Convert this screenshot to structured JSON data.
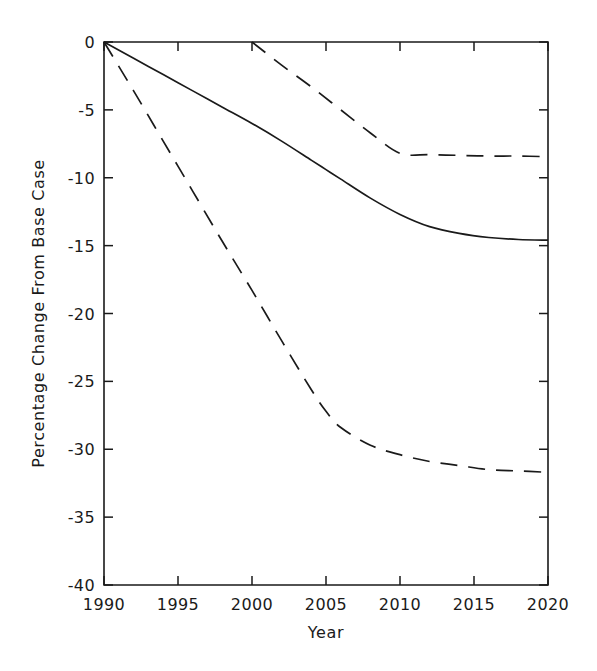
{
  "chart_data": {
    "type": "line",
    "title": "",
    "xlabel": "Year",
    "ylabel": "Percentage Change From Base Case",
    "xlim": [
      1990,
      2020
    ],
    "ylim": [
      -40,
      0
    ],
    "grid": false,
    "legend": "none",
    "background_color": "#ffffff",
    "line_color": "#1a1a1a",
    "xticks": [
      1990,
      1995,
      2000,
      2005,
      2010,
      2015,
      2020
    ],
    "xtick_labels": [
      "1990",
      "1995",
      "2000",
      "2005",
      "2010",
      "2015",
      "2020"
    ],
    "yticks": [
      0,
      -5,
      -10,
      -15,
      -20,
      -25,
      -30,
      -35,
      -40
    ],
    "ytick_labels": [
      "0",
      "-5",
      "-10",
      "-15",
      "-20",
      "-25",
      "-30",
      "-35",
      "-40"
    ],
    "series": [
      {
        "name": "middle-solid",
        "style": "solid",
        "x": [
          1990,
          1992,
          1994,
          1996,
          1998,
          2000,
          2002,
          2004,
          2005,
          2006,
          2008,
          2010,
          2012,
          2014,
          2016,
          2018,
          2020
        ],
        "values": [
          0,
          -1.2,
          -2.4,
          -3.6,
          -4.8,
          -6.0,
          -7.3,
          -8.7,
          -9.4,
          -10.1,
          -11.5,
          -12.7,
          -13.6,
          -14.1,
          -14.4,
          -14.55,
          -14.6
        ]
      },
      {
        "name": "lower-dashed",
        "style": "dashed",
        "x": [
          1990,
          1992,
          1994,
          1996,
          1998,
          2000,
          2002,
          2004,
          2005,
          2006,
          2008,
          2010,
          2012,
          2014,
          2016,
          2018,
          2020
        ],
        "values": [
          0,
          -3.6,
          -7.3,
          -11.0,
          -14.7,
          -18.3,
          -22.0,
          -25.6,
          -27.2,
          -28.4,
          -29.7,
          -30.4,
          -30.9,
          -31.2,
          -31.5,
          -31.6,
          -31.7
        ]
      },
      {
        "name": "upper-dashed",
        "style": "dashed",
        "x": [
          2000,
          2002,
          2004,
          2006,
          2008,
          2010,
          2012,
          2014,
          2016,
          2018,
          2020
        ],
        "values": [
          0,
          -1.7,
          -3.3,
          -5.0,
          -6.7,
          -8.2,
          -8.3,
          -8.35,
          -8.4,
          -8.4,
          -8.45
        ]
      }
    ]
  },
  "figure": {
    "plot_left_px": 104,
    "plot_right_px": 548,
    "plot_top_px": 42,
    "plot_bottom_px": 585
  }
}
